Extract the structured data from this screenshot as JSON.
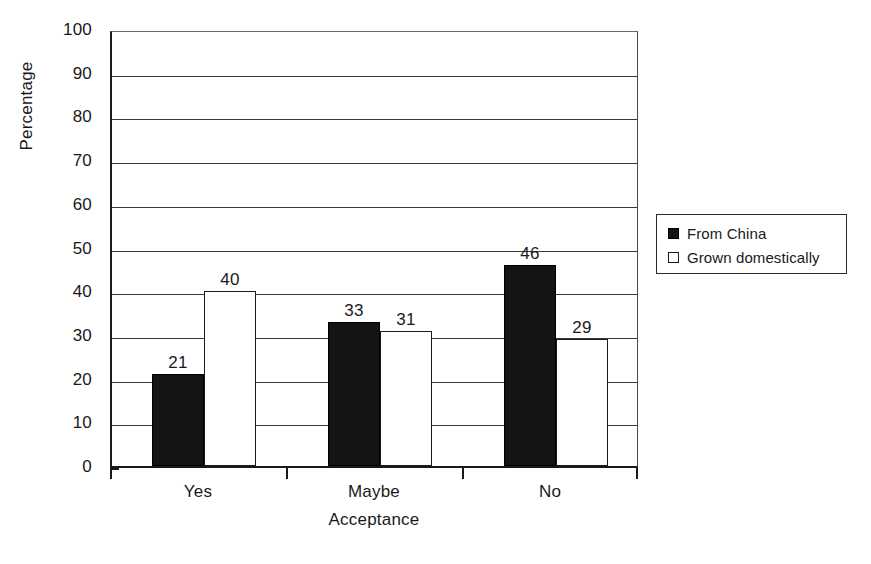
{
  "chart_data": {
    "type": "bar",
    "title": "",
    "subtitle": "",
    "xlabel": "Acceptance",
    "ylabel": "Percentage",
    "categories": [
      "Yes",
      "Maybe",
      "No"
    ],
    "series": [
      {
        "name": "From China",
        "values": [
          21,
          40,
          33
        ],
        "swatch": "filled",
        "color": "#141414"
      },
      {
        "name": "Grown domestically",
        "values": [
          40,
          31,
          29
        ],
        "swatch": "open",
        "color": "#ffffff"
      }
    ],
    "grouped_values": [
      {
        "category": "Yes",
        "From China": 21,
        "Grown domestically": 40
      },
      {
        "category": "Maybe",
        "From China": 33,
        "Grown domestically": 31
      },
      {
        "category": "No",
        "From China": 46,
        "Grown domestically": 29
      }
    ],
    "data_labels": [
      "21",
      "40",
      "33",
      "31",
      "46",
      "29"
    ],
    "ylim": [
      0,
      100
    ],
    "ytick_step": 10,
    "yticks": [
      "100",
      "90",
      "80",
      "70",
      "60",
      "50",
      "40",
      "30",
      "20",
      "10",
      "0"
    ],
    "grid": true,
    "grid_axis": "y",
    "legend_position": "right",
    "axis_color": "#1a1a1a",
    "grid_color": "#3a3a3a",
    "background": "#ffffff"
  },
  "legend": {
    "entries": [
      {
        "label": "From China",
        "swatch": "filled"
      },
      {
        "label": "Grown domestically",
        "swatch": "open"
      }
    ]
  }
}
